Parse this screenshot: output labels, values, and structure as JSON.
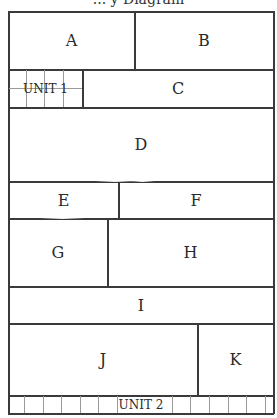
{
  "diagram": {
    "title": "... y Diagram",
    "rows": [
      {
        "cells": [
          {
            "label": "A"
          },
          {
            "label": "B"
          }
        ]
      },
      {
        "cells": [
          {
            "label": "UNIT 1"
          },
          {
            "label": "C"
          }
        ]
      },
      {
        "cells": [
          {
            "label": "D"
          }
        ]
      },
      {
        "cells": [
          {
            "label": "E"
          },
          {
            "label": "F"
          }
        ]
      },
      {
        "cells": [
          {
            "label": "G"
          },
          {
            "label": "H"
          }
        ]
      },
      {
        "cells": [
          {
            "label": "I"
          }
        ]
      },
      {
        "cells": [
          {
            "label": "J"
          },
          {
            "label": "K"
          }
        ]
      },
      {
        "cells": [
          {
            "label": "UNIT 2"
          }
        ]
      }
    ],
    "colors": {
      "line": "#3a3a3a",
      "grid": "#9a9a9a",
      "background": "#ffffff"
    }
  }
}
